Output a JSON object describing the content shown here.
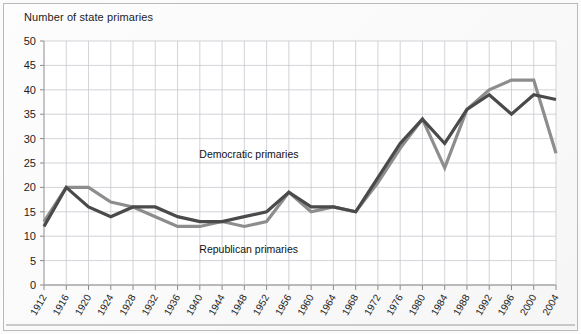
{
  "chart_data": {
    "type": "line",
    "title": "Number of state primaries",
    "xlabel": "",
    "ylabel": "Number of state primaries",
    "ylim": [
      0,
      50
    ],
    "ytick_step": 5,
    "grid": true,
    "legend": "inline-annotations",
    "categories": [
      "1912",
      "1916",
      "1920",
      "1924",
      "1928",
      "1932",
      "1936",
      "1940",
      "1944",
      "1948",
      "1952",
      "1956",
      "1960",
      "1964",
      "1968",
      "1972",
      "1976",
      "1980",
      "1984",
      "1988",
      "1992",
      "1996",
      "2000",
      "2004"
    ],
    "yticks": [
      "0",
      "5",
      "10",
      "15",
      "20",
      "25",
      "30",
      "35",
      "40",
      "45",
      "50"
    ],
    "series": [
      {
        "name": "Democratic primaries",
        "color": "#4a4a4a",
        "values": [
          12,
          20,
          16,
          14,
          16,
          16,
          14,
          13,
          13,
          14,
          15,
          19,
          16,
          16,
          15,
          22,
          29,
          34,
          29,
          36,
          39,
          35,
          39,
          38
        ]
      },
      {
        "name": "Republican primaries",
        "color": "#8d8d8d",
        "values": [
          13,
          20,
          20,
          17,
          16,
          14,
          12,
          12,
          13,
          12,
          13,
          19,
          15,
          16,
          15,
          21,
          28,
          34,
          24,
          36,
          40,
          42,
          42,
          27
        ]
      }
    ],
    "annotations": [
      {
        "text": "Democratic primaries",
        "x_value": "1948",
        "y_value": 26
      },
      {
        "text": "Republican primaries",
        "x_value": "1948",
        "y_value": 6.5
      }
    ]
  }
}
